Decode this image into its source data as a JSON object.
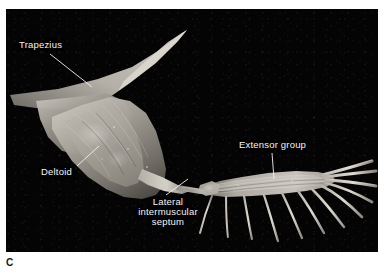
{
  "figure": {
    "panel_letter": "C",
    "kind": "anatomical-dissection-photograph",
    "background_color": "#040404",
    "page_color": "#ffffff",
    "label_color": "#f4f4f4",
    "leader_color": "#f2f2f2",
    "specimen_tone_light": "#cfcbc4",
    "specimen_tone_mid": "#8e8a83",
    "specimen_tone_dark": "#4a4742"
  },
  "plate": {
    "x": 6,
    "y": 9,
    "width": 372,
    "height": 243
  },
  "callouts": [
    {
      "id": "trapezius",
      "label": "Trapezius",
      "lines": [
        "Trapezius"
      ],
      "text_x": 13,
      "text_y": 31,
      "leader": {
        "x1": 44,
        "y1": 45,
        "x2": 86,
        "y2": 78
      }
    },
    {
      "id": "deltoid",
      "label": "Deltoid",
      "lines": [
        "Deltoid"
      ],
      "text_x": 35,
      "text_y": 158,
      "leader": {
        "x1": 71,
        "y1": 157,
        "x2": 93,
        "y2": 137
      }
    },
    {
      "id": "lateral-intermuscular-septum",
      "label": "Lateral intermuscular septum",
      "lines": [
        "Lateral",
        "intermuscular",
        "septum"
      ],
      "text_x": 125,
      "text_y": 188,
      "leader": {
        "x1": 160,
        "y1": 186,
        "x2": 182,
        "y2": 170
      }
    },
    {
      "id": "extensor-group",
      "label": "Extensor group",
      "lines": [
        "Extensor group"
      ],
      "text_x": 233,
      "text_y": 131,
      "leader": {
        "x1": 266,
        "y1": 144,
        "x2": 268,
        "y2": 170
      }
    }
  ]
}
